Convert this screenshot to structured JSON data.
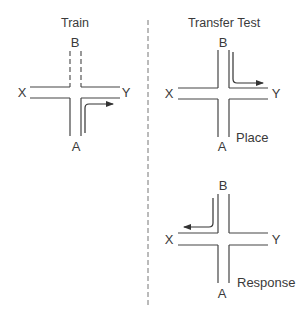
{
  "panels": {
    "train": {
      "title": "Train",
      "labels": {
        "north": "B",
        "south": "A",
        "west": "X",
        "east": "Y"
      },
      "blocked_arm": "B",
      "path": "A to Y (turn right)"
    },
    "transfer": {
      "title": "Transfer Test",
      "place": {
        "labels": {
          "north": "B",
          "south": "A",
          "west": "X",
          "east": "Y"
        },
        "condition": "Place",
        "path": "B to Y (turn left)"
      },
      "response": {
        "labels": {
          "north": "B",
          "south": "A",
          "west": "X",
          "east": "Y"
        },
        "condition": "Response",
        "path": "B to X (turn right)"
      }
    }
  },
  "colors": {
    "line": "#444444",
    "text": "#3a3a3a",
    "background": "#ffffff"
  }
}
